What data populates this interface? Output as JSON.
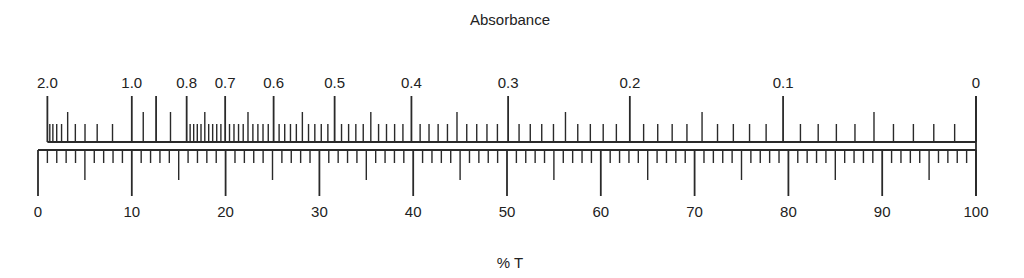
{
  "diagram": {
    "top_title": "Absorbance",
    "bottom_title": "% T",
    "absorbance_labels": [
      {
        "text": "2.0",
        "value": 2.0
      },
      {
        "text": "1.0",
        "value": 1.0
      },
      {
        "text": "0.8",
        "value": 0.8
      },
      {
        "text": "0.7",
        "value": 0.7
      },
      {
        "text": "0.6",
        "value": 0.6
      },
      {
        "text": "0.5",
        "value": 0.5
      },
      {
        "text": "0.4",
        "value": 0.4
      },
      {
        "text": "0.3",
        "value": 0.3
      },
      {
        "text": "0.2",
        "value": 0.2
      },
      {
        "text": "0.1",
        "value": 0.1
      },
      {
        "text": "0",
        "value": 0
      }
    ],
    "transmittance_labels": [
      {
        "text": "0",
        "value": 0
      },
      {
        "text": "10",
        "value": 10
      },
      {
        "text": "20",
        "value": 20
      },
      {
        "text": "30",
        "value": 30
      },
      {
        "text": "40",
        "value": 40
      },
      {
        "text": "50",
        "value": 50
      },
      {
        "text": "60",
        "value": 60
      },
      {
        "text": "70",
        "value": 70
      },
      {
        "text": "80",
        "value": 80
      },
      {
        "text": "90",
        "value": 90
      },
      {
        "text": "100",
        "value": 100
      }
    ],
    "relation": "A = 2 - log10(%T)",
    "line_color": "#2a2a2a"
  }
}
